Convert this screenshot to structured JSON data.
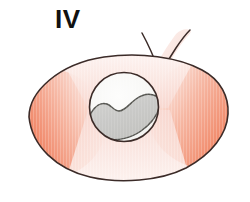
{
  "figure": {
    "panel_label": "IV",
    "kind": "anatomical-illustration",
    "background_color": "#ffffff"
  },
  "colors": {
    "outline": "#3b2b28",
    "organ_coral_deep": "#ef7356",
    "organ_coral": "#f08363",
    "organ_coral_light": "#f4a189",
    "organ_pale_pink": "#fae5e0",
    "organ_pale_pink_light": "#fdf2ef",
    "inset_fill": "#f7f7f5",
    "inset_outline": "#3b2b28",
    "lesion_fill": "#cacaca",
    "lesion_outline": "#555550",
    "stem_fill": "#fae7e2",
    "label_color": "#111111"
  },
  "organ": {
    "name": "organ-body",
    "shape": "ovoid",
    "center_x": 128,
    "center_y": 118,
    "radius_x": 100,
    "radius_y": 62,
    "zones": [
      {
        "name": "left-pole",
        "tone": "coral-deep",
        "color": "#ef7356"
      },
      {
        "name": "right-pole",
        "tone": "coral",
        "color": "#f08363"
      },
      {
        "name": "superior-band",
        "tone": "pale-pink",
        "color": "#fae5e0"
      },
      {
        "name": "inferior-band",
        "tone": "pale-pink",
        "color": "#fae5e0"
      }
    ]
  },
  "stem": {
    "name": "vessel-pedicle",
    "position": "top-right",
    "fill": "#fae7e2",
    "outline": "#3b2b28",
    "line_count": 2
  },
  "inset": {
    "name": "magnified-inset",
    "shape": "circle",
    "center_x": 124,
    "center_y": 107,
    "radius": 35,
    "fill": "#f7f7f5",
    "outline": "#3b2b28"
  },
  "lesion": {
    "name": "lesion-region",
    "shape": "sigmoid",
    "fill": "#cacaca",
    "outline": "#555550",
    "description": "gray S-shaped wavy region inside the inset circle"
  }
}
